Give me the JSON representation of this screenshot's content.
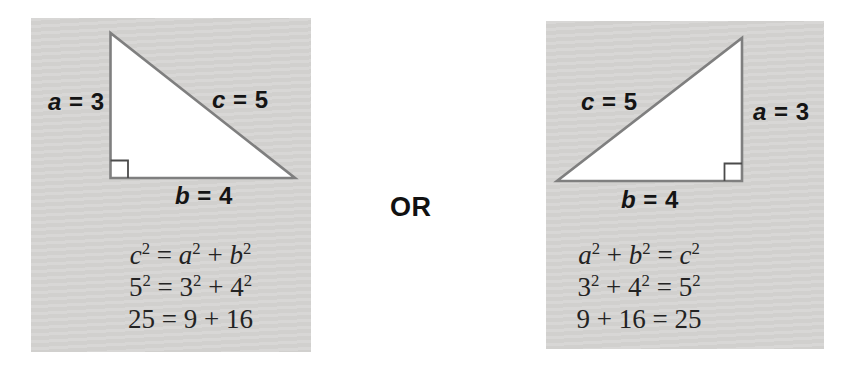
{
  "page": {
    "or_label": "OR"
  },
  "colors": {
    "page_bg": "#ffffff",
    "panel_bg": "#d4d3d1",
    "triangle_fill": "#ffffff",
    "triangle_stroke": "#7f7f7f",
    "right_angle_stroke": "#4b4b4b",
    "side_label_text": "#141414",
    "equation_text": "#232323",
    "or_text": "#111111"
  },
  "left_figure": {
    "labels": {
      "side_a": "a = 3",
      "side_b": "b = 4",
      "hypotenuse": "c = 5"
    },
    "right_angle_position": "bottom-left",
    "equations": [
      "c^2 = a^2 + b^2",
      "5^2 = 3^2 + 4^2",
      "25 = 9 + 16"
    ]
  },
  "right_figure": {
    "labels": {
      "side_a": "a = 3",
      "side_b": "b = 4",
      "hypotenuse": "c = 5"
    },
    "right_angle_position": "bottom-right",
    "equations": [
      "a^2 + b^2 = c^2",
      "3^2 + 4^2 = 5^2",
      "9 + 16 = 25"
    ]
  }
}
